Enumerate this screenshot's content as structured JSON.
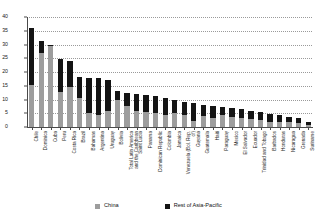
{
  "chart_data": {
    "type": "bar",
    "stacked": true,
    "title": "",
    "subtitle": "",
    "xlabel": "",
    "ylabel": "",
    "ylim": [
      0,
      40
    ],
    "yticks": [
      0,
      5,
      10,
      15,
      20,
      25,
      30,
      35,
      40
    ],
    "ytick_labels": [
      "0",
      "5",
      "10",
      "15",
      "20",
      "25",
      "30",
      "35",
      "40"
    ],
    "grid": true,
    "grid_style": "dotted-horizontal",
    "legend_position": "bottom",
    "categories": [
      "Chile",
      "Dominica",
      "Cuba",
      "Peru",
      "Costa Rica",
      "Brazil",
      "Bahamas",
      "Argentina",
      "Uruguay",
      "Bolivia",
      "Total Latin America and the Caribbean",
      "Saint Lucia",
      "Panama",
      "Dominican Republic",
      "Colombia",
      "Jamaica",
      "Venezuela (Bol. Rep. of)",
      "Guyana",
      "Guatemala",
      "Haiti",
      "Paraguay",
      "Mexico",
      "El Salvador",
      "Ecuador",
      "Trinidad and Tobago",
      "Barbados",
      "Honduras",
      "Nicaragua",
      "Grenada",
      "Suriname"
    ],
    "series": [
      {
        "name": "China",
        "color": "#9d9d9d",
        "values": [
          15.2,
          27.0,
          29.3,
          12.8,
          14.6,
          10.5,
          5.2,
          4.4,
          6.0,
          10.0,
          7.6,
          5.8,
          5.6,
          5.0,
          4.4,
          5.2,
          4.2,
          2.2,
          3.9,
          3.3,
          4.2,
          3.6,
          3.1,
          2.8,
          2.5,
          2.0,
          2.0,
          1.7,
          1.6,
          0.8
        ]
      },
      {
        "name": "Rest of Asia-Pacific",
        "color": "#141414",
        "values": [
          20.8,
          4.2,
          0.5,
          11.8,
          9.5,
          7.6,
          12.6,
          13.3,
          11.0,
          3.0,
          4.8,
          6.2,
          6.0,
          6.1,
          6.2,
          4.5,
          5.0,
          6.5,
          4.2,
          4.4,
          3.2,
          3.4,
          3.3,
          3.2,
          2.8,
          2.9,
          2.4,
          2.1,
          1.6,
          1.0
        ]
      }
    ],
    "totals": [
      36.0,
      31.2,
      29.8,
      24.6,
      24.1,
      18.1,
      17.8,
      17.7,
      17.0,
      13.0,
      12.4,
      12.0,
      11.6,
      11.1,
      10.6,
      9.7,
      9.2,
      8.7,
      8.1,
      7.7,
      7.4,
      7.0,
      6.4,
      6.0,
      5.3,
      4.9,
      4.4,
      3.8,
      3.2,
      1.8
    ]
  },
  "legend": {
    "items": [
      {
        "label": "China",
        "color": "#9d9d9d"
      },
      {
        "label": "Rest of Asia-Pacific",
        "color": "#141414"
      }
    ]
  }
}
